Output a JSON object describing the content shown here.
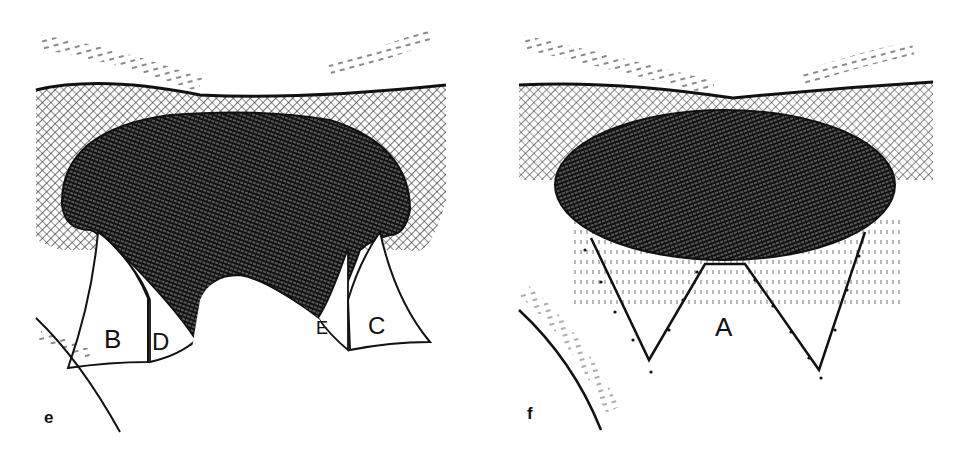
{
  "figure": {
    "background": "#ffffff",
    "ink_color": "#111111",
    "panels": [
      {
        "id": "e",
        "letter": "e",
        "flap_labels": [
          "B",
          "D",
          "E",
          "C"
        ]
      },
      {
        "id": "f",
        "letter": "f",
        "flap_labels": [
          "A"
        ]
      }
    ]
  }
}
